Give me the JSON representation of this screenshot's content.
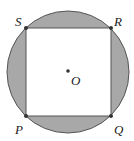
{
  "diagram": {
    "colors": {
      "shade": "#a8a8a8",
      "stroke": "#555555",
      "fill_inner": "#ffffff",
      "point": "#333333"
    },
    "circle": {
      "cx": 68,
      "cy": 72,
      "r": 62
    },
    "square": {
      "x": 26,
      "y": 28,
      "w": 85,
      "h": 88
    },
    "points": [
      {
        "name": "S",
        "x": 26,
        "y": 28,
        "lx": 15,
        "ly": 24
      },
      {
        "name": "R",
        "x": 111,
        "y": 28,
        "lx": 114,
        "ly": 24
      },
      {
        "name": "Q",
        "x": 111,
        "y": 116,
        "lx": 114,
        "ly": 132
      },
      {
        "name": "P",
        "x": 26,
        "y": 116,
        "lx": 15,
        "ly": 132
      },
      {
        "name": "O",
        "x": 68,
        "y": 71,
        "lx": 72,
        "ly": 84
      }
    ]
  }
}
